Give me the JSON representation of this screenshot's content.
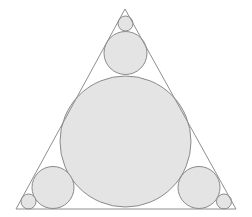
{
  "diagram": {
    "title": "",
    "width": 252,
    "height": 217,
    "background": "#ffffff",
    "colors": {
      "circle_fill": "#e4e4e4",
      "circle_stroke": "#8a8a8a",
      "triangle_stroke": "#8f8f8f"
    },
    "triangle": {
      "points": [
        [
          125,
          9
        ],
        [
          16,
          209
        ],
        [
          236,
          209
        ]
      ]
    },
    "circles": [
      {
        "name": "large-center-circle",
        "cx": 125.5,
        "cy": 141.5,
        "r": 65.5
      },
      {
        "name": "top-medium-circle",
        "cx": 125.5,
        "cy": 53,
        "r": 21.5
      },
      {
        "name": "top-small-circle",
        "cx": 125.5,
        "cy": 23.5,
        "r": 7.5
      },
      {
        "name": "left-medium-circle",
        "cx": 53,
        "cy": 187.5,
        "r": 21
      },
      {
        "name": "left-small-circle",
        "cx": 28.5,
        "cy": 201.5,
        "r": 7.5
      },
      {
        "name": "right-medium-circle",
        "cx": 199,
        "cy": 187.5,
        "r": 21
      },
      {
        "name": "right-small-circle",
        "cx": 224,
        "cy": 201.5,
        "r": 7.5
      }
    ]
  }
}
